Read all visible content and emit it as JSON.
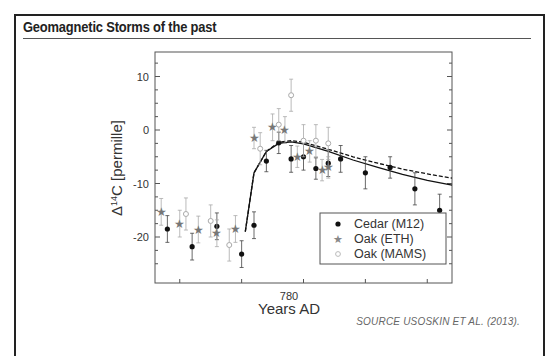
{
  "header": {
    "title": "Geomagnetic Storms of the past"
  },
  "footer": {
    "source": "SOURCE USOSKIN ET AL. (2013)."
  },
  "chart_data": {
    "type": "scatter",
    "title": "Geomagnetic Storms of the past",
    "xlabel": "Years AD",
    "ylabel": "Δ14C [permille]",
    "x_tick_labels": [
      "780"
    ],
    "y_tick_labels": [
      "10",
      "0",
      "-10",
      "-20"
    ],
    "ylim": [
      -27,
      14
    ],
    "xlim": [
      768,
      792
    ],
    "legend_position": "lower-right",
    "legend": [
      "Cedar (M12)",
      "Oak (ETH)",
      "Oak (MAMS)"
    ],
    "series": [
      {
        "name": "Cedar (M12)",
        "marker": "filled-circle",
        "color": "#111111",
        "x": [
          769,
          771,
          773,
          775,
          776,
          777,
          778,
          779,
          780,
          781,
          782,
          783,
          785,
          787,
          789,
          791
        ],
        "y": [
          -18.5,
          -21.8,
          -18,
          -23.2,
          -17.8,
          -5.8,
          -2.4,
          -5.4,
          -5,
          -7.2,
          -6.2,
          -5.4,
          -8,
          -7,
          -11,
          -15
        ],
        "err": [
          2.5,
          2.5,
          2.5,
          2.5,
          2.5,
          2,
          2,
          2.5,
          2.5,
          2,
          2.5,
          2.5,
          3,
          2,
          3,
          3
        ]
      },
      {
        "name": "Oak (ETH)",
        "marker": "star",
        "color": "#777777",
        "x": [
          768.5,
          770,
          771.5,
          773,
          774.5,
          776,
          777.5,
          778.5,
          779.5,
          780.5,
          781.5,
          782
        ],
        "y": [
          -15.3,
          -17.5,
          -18.6,
          -19.3,
          -18.5,
          -1.5,
          0.5,
          0,
          -5,
          -4,
          -7.5,
          -7
        ],
        "err": [
          2.5,
          2.5,
          2.5,
          2.5,
          2.5,
          2,
          2.5,
          2.5,
          2,
          2,
          2,
          2
        ]
      },
      {
        "name": "Oak (MAMS)",
        "marker": "open-circle",
        "color": "#999999",
        "x": [
          770.5,
          772.5,
          774,
          776.5,
          778,
          779,
          780,
          781,
          782
        ],
        "y": [
          -15.7,
          -17,
          -21.5,
          -3.5,
          1,
          6.5,
          -2,
          -2,
          -2.5
        ],
        "err": [
          3,
          3,
          3,
          3,
          3,
          3,
          3,
          3,
          3
        ]
      },
      {
        "name": "Model (solid)",
        "type": "line",
        "style": "solid",
        "x": [
          775.3,
          776,
          777,
          778,
          779,
          780,
          782,
          784,
          786,
          788,
          790,
          792
        ],
        "y": [
          -19,
          -8,
          -4,
          -2.5,
          -2.2,
          -2.6,
          -4,
          -5.6,
          -7,
          -8.3,
          -9.4,
          -10.3
        ]
      },
      {
        "name": "Model (dashed)",
        "type": "line",
        "style": "dashed",
        "x": [
          775.3,
          776,
          777,
          778,
          779,
          780,
          782,
          784,
          786,
          788,
          790,
          792
        ],
        "y": [
          -19,
          -8,
          -4,
          -2.3,
          -2,
          -2.3,
          -3.6,
          -5,
          -6.2,
          -7.3,
          -8.2,
          -9
        ]
      }
    ]
  }
}
